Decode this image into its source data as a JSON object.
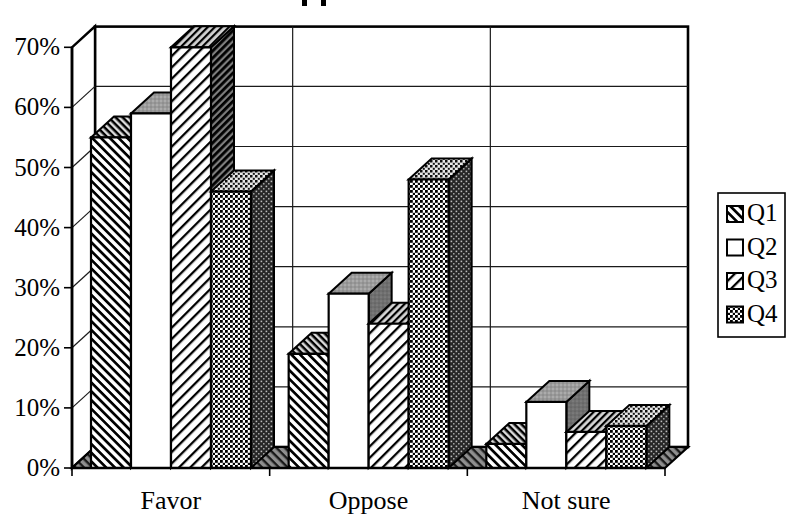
{
  "chart_data": {
    "type": "bar",
    "subtype": "3d-clustered-bar",
    "title": "",
    "title_fragment": {
      "visible": true,
      "desc": "cropped title: only two letter-descender marks visible at top edge"
    },
    "categories": [
      "Favor",
      "Oppose",
      "Not sure"
    ],
    "series": [
      {
        "name": "Q1",
        "values": [
          55,
          19,
          4
        ],
        "pattern": "diagonal-backslash-hatch"
      },
      {
        "name": "Q2",
        "values": [
          59,
          29,
          11
        ],
        "pattern": "plain-white"
      },
      {
        "name": "Q3",
        "values": [
          70,
          24,
          6
        ],
        "pattern": "diagonal-slash-hatch"
      },
      {
        "name": "Q4",
        "values": [
          46,
          48,
          7
        ],
        "pattern": "dot-checker"
      }
    ],
    "ylabel_ticks": [
      "0%",
      "10%",
      "20%",
      "30%",
      "40%",
      "50%",
      "60%",
      "70%"
    ],
    "ylim": [
      0,
      70
    ],
    "y_step": 10,
    "grid": true,
    "legend": {
      "position": "right",
      "entries": [
        "Q1",
        "Q2",
        "Q3",
        "Q4"
      ]
    }
  },
  "colors": {
    "ink": "#000000",
    "background": "#ffffff",
    "floor_gray": "#8f8f8f",
    "q2_top_gray": "#9a9a9a",
    "q2_side_gray": "#6f6f6f"
  }
}
